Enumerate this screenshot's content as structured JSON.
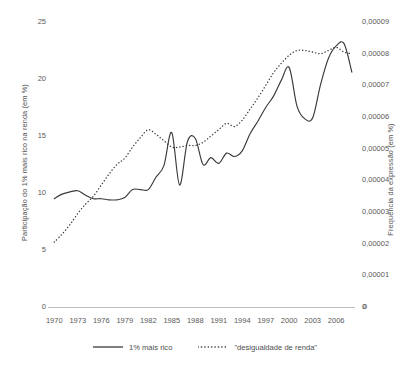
{
  "chart_data": {
    "type": "line",
    "title": "",
    "xlabel": "",
    "grid": false,
    "legend_position": "bottom",
    "x": [
      1970,
      1971,
      1972,
      1973,
      1974,
      1975,
      1976,
      1977,
      1978,
      1979,
      1980,
      1981,
      1982,
      1983,
      1984,
      1985,
      1986,
      1987,
      1988,
      1989,
      1990,
      1991,
      1992,
      1993,
      1994,
      1995,
      1996,
      1997,
      1998,
      1999,
      2000,
      2001,
      2002,
      2003,
      2004,
      2005,
      2006,
      2007,
      2008
    ],
    "xlim": [
      1969.2,
      2008.4
    ],
    "xticks": [
      "1970",
      "1973",
      "1976",
      "1979",
      "1982",
      "1985",
      "1988",
      "1991",
      "1994",
      "1997",
      "2000",
      "2003",
      "2006"
    ],
    "axes": {
      "left": {
        "label": "Participação do 1% mais rico na renda (em %)",
        "ticks": [
          "25",
          "20",
          "15",
          "10",
          "5",
          "0"
        ],
        "tick_values": [
          25,
          20,
          15,
          10,
          5,
          0
        ],
        "ylim": [
          0,
          25
        ]
      },
      "right": {
        "label": "Frequência da expressão (em %)",
        "ticks": [
          "0,00009",
          "0,00008",
          "0,00007",
          "0,00006",
          "0,00005",
          "0,00004",
          "0,00003",
          "0,00002",
          "0,00001",
          "0"
        ],
        "tick_values": [
          9e-05,
          8e-05,
          7e-05,
          6e-05,
          5e-05,
          4e-05,
          3e-05,
          2e-05,
          1e-05,
          0
        ],
        "ylim": [
          0,
          9e-05
        ]
      }
    },
    "series": [
      {
        "name": "1% mais rico",
        "axis": "left",
        "style": "solid",
        "color": "#3a3a3a",
        "values": [
          9.5,
          9.9,
          10.1,
          10.2,
          9.8,
          9.5,
          9.5,
          9.4,
          9.4,
          9.6,
          10.3,
          10.3,
          10.3,
          11.4,
          12.4,
          15.3,
          10.7,
          14.5,
          14.8,
          12.5,
          13.1,
          12.6,
          13.5,
          13.2,
          13.7,
          15.2,
          16.3,
          17.5,
          18.5,
          19.9,
          21.0,
          17.6,
          16.5,
          16.6,
          19.5,
          21.8,
          22.9,
          23.1,
          20.6
        ]
      },
      {
        "name": "\"desigualdade de renda\"",
        "axis": "right",
        "style": "dotted",
        "color": "#3a3a3a",
        "values": [
          2.05e-05,
          2.3e-05,
          2.6e-05,
          2.95e-05,
          3.25e-05,
          3.5e-05,
          3.85e-05,
          4.2e-05,
          4.5e-05,
          4.7e-05,
          5.05e-05,
          5.35e-05,
          5.6e-05,
          5.45e-05,
          5.25e-05,
          5.05e-05,
          5.05e-05,
          5.1e-05,
          5.1e-05,
          5.2e-05,
          5.4e-05,
          5.6e-05,
          5.8e-05,
          5.7e-05,
          5.9e-05,
          6.25e-05,
          6.6e-05,
          7e-05,
          7.4e-05,
          7.7e-05,
          7.95e-05,
          8.1e-05,
          8.1e-05,
          8.05e-05,
          8e-05,
          8.1e-05,
          8.2e-05,
          8.05e-05,
          8e-05
        ]
      }
    ],
    "corner_zero_left": "0",
    "corner_zero_right": "0"
  }
}
